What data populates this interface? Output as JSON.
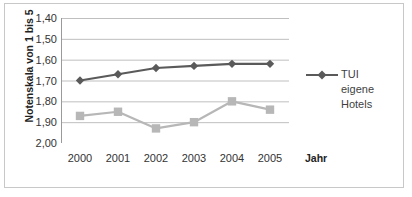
{
  "chart_data": {
    "type": "line",
    "title": "",
    "subtitle": "",
    "xlabel": "Jahr",
    "ylabel": "Notenskala von 1 bis 5",
    "categories": [
      "2000",
      "2001",
      "2002",
      "2003",
      "2004",
      "2005"
    ],
    "y_ticks": [
      "1,40",
      "1,50",
      "1,60",
      "1,70",
      "1,80",
      "1,90",
      "2,00"
    ],
    "y_tick_values": [
      1.4,
      1.5,
      1.6,
      1.7,
      1.8,
      1.9,
      2.0
    ],
    "ylim": [
      1.4,
      2.0
    ],
    "y_axis_inverted": true,
    "grid": true,
    "legend_position": "right",
    "series": [
      {
        "name": "TUI eigene Hotels",
        "color": "#5a5a5a",
        "marker": "diamond",
        "values": [
          1.7,
          1.67,
          1.64,
          1.63,
          1.62,
          1.62
        ]
      },
      {
        "name": "",
        "color": "#b7b7b7",
        "marker": "square",
        "values": [
          1.87,
          1.85,
          1.93,
          1.9,
          1.8,
          1.84
        ]
      }
    ]
  },
  "axes": {
    "y_title": "Notenskala von 1 bis 5",
    "x_title": "Jahr"
  },
  "legend": {
    "entries": [
      {
        "label_line1": "TUI",
        "label_line2": "eigene",
        "label_line3": "Hotels",
        "color": "#5a5a5a",
        "marker": "diamond"
      }
    ]
  },
  "colors": {
    "series_dark": "#5a5a5a",
    "series_light": "#b7b7b7",
    "gridline": "#bfbfbf",
    "axis": "#9a9a9a",
    "border": "#c8c8c8",
    "text": "#333333"
  }
}
